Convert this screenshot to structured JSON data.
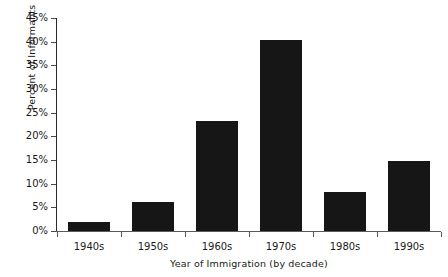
{
  "chart_data": {
    "type": "bar",
    "title": "",
    "xlabel": "Year of Immigration (by decade)",
    "ylabel": "Percent of Informants",
    "categories": [
      "1940s",
      "1950s",
      "1960s",
      "1970s",
      "1980s",
      "1990s"
    ],
    "values": [
      2.0,
      6.2,
      23.2,
      40.3,
      8.3,
      14.7
    ],
    "value_labels": [
      "2%",
      "6.2%",
      "23.2%",
      "40.3%",
      "8.3%",
      "14.7%"
    ],
    "ylim": [
      0,
      45
    ],
    "ytick_step": 5,
    "ytick_labels": [
      "0%",
      "5%",
      "10%",
      "15%",
      "20%",
      "25%",
      "30%",
      "35%",
      "40%",
      "45%"
    ],
    "ytick_values": [
      0,
      5,
      10,
      15,
      20,
      25,
      30,
      35,
      40,
      45
    ],
    "grid": false,
    "legend": false,
    "legend_position": "none",
    "series": [
      {
        "name": "Percent of Informants",
        "values": [
          2.0,
          6.2,
          23.2,
          40.3,
          8.3,
          14.7
        ],
        "color": "#161616"
      }
    ],
    "colors": {
      "bar": "#161616",
      "axis": "#2b2b2b",
      "text": "#1a1a1a",
      "background": "#ffffff"
    }
  }
}
